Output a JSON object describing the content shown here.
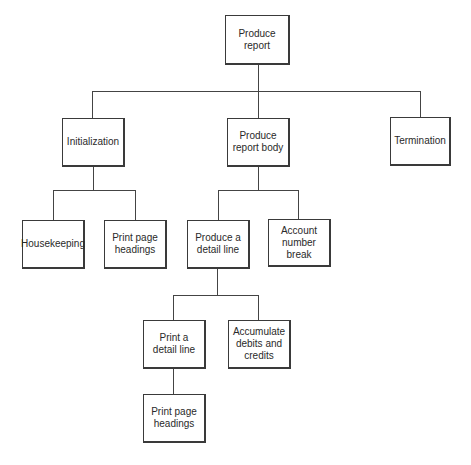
{
  "diagram": {
    "type": "hierarchy-chart",
    "nodes": {
      "root": "Produce\nreport",
      "initialization": "Initialization",
      "report_body": "Produce\nreport body",
      "termination": "Termination",
      "housekeeping": "Housekeeping",
      "print_headings_1": "Print page\nheadings",
      "detail_line": "Produce a\ndetail line",
      "account_break": "Account\nnumber break",
      "print_detail": "Print a\ndetail line",
      "accumulate": "Accumulate\ndebits and\ncredits",
      "print_headings_2": "Print page\nheadings"
    },
    "edges": [
      [
        "root",
        "initialization"
      ],
      [
        "root",
        "report_body"
      ],
      [
        "root",
        "termination"
      ],
      [
        "initialization",
        "housekeeping"
      ],
      [
        "initialization",
        "print_headings_1"
      ],
      [
        "report_body",
        "detail_line"
      ],
      [
        "report_body",
        "account_break"
      ],
      [
        "detail_line",
        "print_detail"
      ],
      [
        "detail_line",
        "accumulate"
      ],
      [
        "print_detail",
        "print_headings_2"
      ]
    ]
  }
}
